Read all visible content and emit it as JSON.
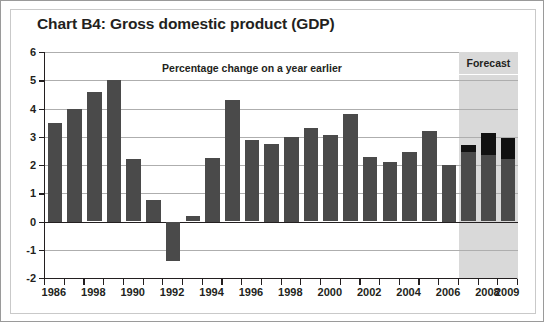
{
  "chart_data": {
    "type": "bar",
    "title": "Chart B4: Gross domestic product (GDP)",
    "subtitle": "Percentage change on a year earlier",
    "xlabel": "",
    "ylabel": "",
    "ylim": [
      -2,
      6
    ],
    "ytick_values": [
      6,
      5,
      4,
      3,
      2,
      1,
      0,
      -1,
      -2
    ],
    "ytick_labels": [
      "6",
      "5",
      "4",
      "3",
      "2",
      "1",
      "0",
      "-1",
      "-2"
    ],
    "grid": true,
    "legend": null,
    "annotations": [
      {
        "text": "Forecast",
        "region_start_year": 2007,
        "region_end_year": 2009
      }
    ],
    "categories": [
      "1986",
      "1987",
      "1988",
      "1989",
      "1990",
      "1991",
      "1992",
      "1993",
      "1994",
      "1995",
      "1996",
      "1997",
      "1998",
      "1999",
      "2000",
      "2001",
      "2002",
      "2003",
      "2004",
      "2005",
      "2006",
      "2007",
      "2008",
      "2009"
    ],
    "xtick_labels_shown": [
      {
        "index": 0,
        "label": "1986"
      },
      {
        "index": 2,
        "label": "1998"
      },
      {
        "index": 4,
        "label": "1990"
      },
      {
        "index": 6,
        "label": "1992"
      },
      {
        "index": 8,
        "label": "1994"
      },
      {
        "index": 10,
        "label": "1996"
      },
      {
        "index": 12,
        "label": "1998"
      },
      {
        "index": 14,
        "label": "2000"
      },
      {
        "index": 16,
        "label": "2002"
      },
      {
        "index": 18,
        "label": "2004"
      },
      {
        "index": 20,
        "label": "2006"
      },
      {
        "index": 22,
        "label": "2008"
      },
      {
        "index": 23,
        "label": "2009"
      }
    ],
    "values": [
      3.5,
      4.0,
      4.6,
      5.0,
      2.2,
      0.75,
      -1.4,
      0.2,
      2.25,
      4.3,
      2.9,
      2.75,
      3.0,
      3.3,
      3.05,
      3.8,
      2.3,
      2.1,
      2.45,
      3.2,
      2.0,
      2.7,
      3.15,
      2.95
    ],
    "cap_values": [
      null,
      null,
      null,
      null,
      null,
      null,
      null,
      null,
      null,
      null,
      null,
      null,
      null,
      null,
      null,
      null,
      null,
      null,
      null,
      null,
      null,
      2.45,
      2.35,
      2.2
    ],
    "colors": {
      "bar": "#4a4a4a",
      "bar_cap": "#111111",
      "forecast_band": "#d9d9d9",
      "axis": "#231f20",
      "grid": "#aeaeae",
      "background": "#ffffff"
    }
  }
}
